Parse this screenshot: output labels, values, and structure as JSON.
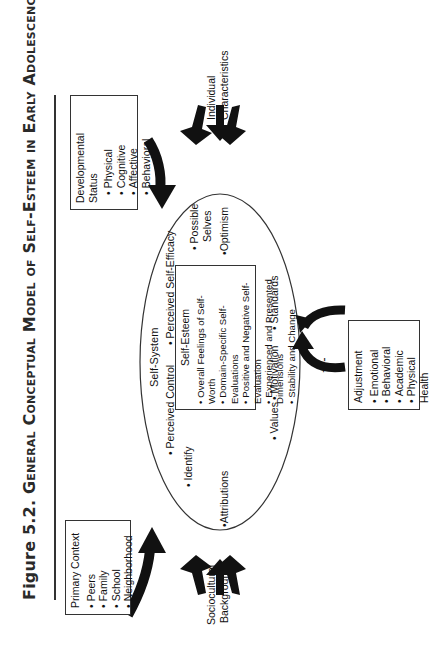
{
  "title": {
    "prefix": "Figure 5.2. ",
    "text": "General Conceptual Model of Self-Esteem in Early Adolescence"
  },
  "primary_context": {
    "heading": "Primary Context",
    "items": [
      "Peers",
      "Family",
      "School",
      "Neighborhood"
    ]
  },
  "developmental_status": {
    "heading": "Developmental Status",
    "items": [
      "Physical",
      "Cognitive",
      "Affective",
      "Behavioral"
    ]
  },
  "individual_characteristics": {
    "line1": "Individual",
    "line2": "Characteristics"
  },
  "sociocultural_background": {
    "line1": "Sociocultural",
    "line2": "Background"
  },
  "self_system": {
    "heading": "Self-System",
    "identify": "Identify",
    "attributions": "Attributions",
    "perceived_control": "Perceived Control",
    "perceived_self_efficacy": "Perceived Self-Efficacy",
    "possible_selves_1": "Possible",
    "possible_selves_2": "Selves",
    "optimism": "Optimism",
    "values": "Values",
    "motivation": "Motivation",
    "standards": "Standards"
  },
  "self_esteem": {
    "heading": "Self-Esteem",
    "items": [
      "Overall Feelings of Self-Worth",
      "Domain-Specific Self-Evaluations",
      "Positive and Negative Self-Evaluation",
      "Experienced and Presented Dimensions",
      "Stability and Change"
    ]
  },
  "adjustment": {
    "heading": "Adjustment",
    "items": [
      "Emotional",
      "Behavioral",
      "Academic",
      "Physical Health"
    ]
  },
  "feedback_label": "+/-",
  "colors": {
    "ink": "#111111",
    "line": "#333333",
    "background": "#ffffff"
  }
}
